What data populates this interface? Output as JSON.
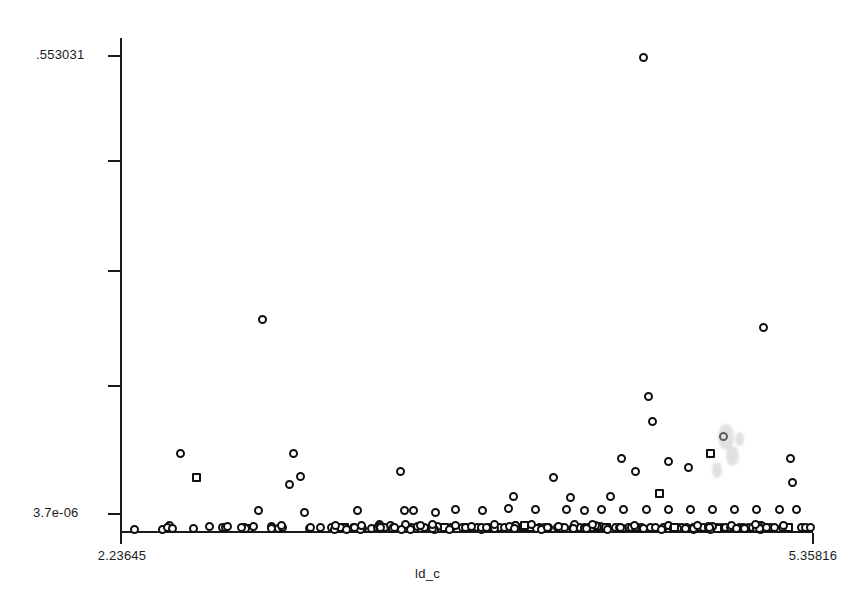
{
  "chart_data": {
    "type": "scatter",
    "title": "",
    "xlabel": "ld_c",
    "ylabel": "",
    "xlim": [
      2.23645,
      5.35816
    ],
    "ylim": [
      3.7e-06,
      0.553031
    ],
    "grid": false,
    "legend": null,
    "x_tick_labels": [
      "2.23645",
      "5.35816"
    ],
    "y_tick_labels": [
      "553031",
      "3.7e-06"
    ],
    "y_tick_label_top": ".553031",
    "y_tick_label_bottom": "3.7e-06",
    "n_y_ticks": 5,
    "n_points": 232,
    "marker": "open-circle",
    "points": [
      [
        2.3,
        0.002
      ],
      [
        2.43,
        0.002
      ],
      [
        2.64,
        0.005
      ],
      [
        2.7,
        0.0035
      ],
      [
        2.58,
        0.061
      ],
      [
        2.51,
        0.088
      ],
      [
        2.8,
        0.0045
      ],
      [
        2.86,
        0.023
      ],
      [
        2.92,
        0.0055
      ],
      [
        2.92,
        0.003
      ],
      [
        2.95,
        0.003
      ],
      [
        2.97,
        0.0035
      ],
      [
        3.02,
        0.088
      ],
      [
        3.05,
        0.062
      ],
      [
        3.0,
        0.053
      ],
      [
        3.07,
        0.021
      ],
      [
        3.09,
        0.003
      ],
      [
        2.88,
        0.241
      ],
      [
        3.14,
        0.004
      ],
      [
        3.19,
        0.0045
      ],
      [
        3.22,
        0.003
      ],
      [
        3.25,
        0.0035
      ],
      [
        3.29,
        0.0045
      ],
      [
        3.33,
        0.003
      ],
      [
        3.31,
        0.023
      ],
      [
        3.37,
        0.003
      ],
      [
        3.4,
        0.004
      ],
      [
        3.43,
        0.0035
      ],
      [
        3.46,
        0.0035
      ],
      [
        3.5,
        0.068
      ],
      [
        3.52,
        0.0235
      ],
      [
        3.55,
        0.0045
      ],
      [
        3.58,
        0.005
      ],
      [
        3.56,
        0.023
      ],
      [
        3.61,
        0.004
      ],
      [
        3.64,
        0.004
      ],
      [
        3.67,
        0.005
      ],
      [
        3.66,
        0.0215
      ],
      [
        3.7,
        0.004
      ],
      [
        3.73,
        0.0035
      ],
      [
        3.75,
        0.024
      ],
      [
        3.78,
        0.0035
      ],
      [
        3.8,
        0.0045
      ],
      [
        3.82,
        0.0035
      ],
      [
        3.85,
        0.004
      ],
      [
        3.87,
        0.023
      ],
      [
        3.9,
        0.0035
      ],
      [
        3.92,
        0.004
      ],
      [
        3.95,
        0.0035
      ],
      [
        3.97,
        0.004
      ],
      [
        3.99,
        0.026
      ],
      [
        4.01,
        0.039
      ],
      [
        4.03,
        0.0035
      ],
      [
        4.05,
        0.0045
      ],
      [
        4.07,
        0.0035
      ],
      [
        4.09,
        0.004
      ],
      [
        4.11,
        0.025
      ],
      [
        4.13,
        0.0035
      ],
      [
        4.15,
        0.004
      ],
      [
        4.17,
        0.0035
      ],
      [
        4.19,
        0.061
      ],
      [
        4.21,
        0.0045
      ],
      [
        4.23,
        0.0035
      ],
      [
        4.25,
        0.025
      ],
      [
        4.27,
        0.038
      ],
      [
        4.29,
        0.0035
      ],
      [
        4.31,
        0.004
      ],
      [
        4.33,
        0.023
      ],
      [
        4.35,
        0.0035
      ],
      [
        4.37,
        0.0045
      ],
      [
        4.39,
        0.0035
      ],
      [
        4.41,
        0.024
      ],
      [
        4.43,
        0.0035
      ],
      [
        4.45,
        0.039
      ],
      [
        4.47,
        0.004
      ],
      [
        4.49,
        0.0035
      ],
      [
        4.51,
        0.025
      ],
      [
        4.53,
        0.0035
      ],
      [
        4.55,
        0.0045
      ],
      [
        4.57,
        0.0035
      ],
      [
        4.5,
        0.082
      ],
      [
        4.56,
        0.068
      ],
      [
        4.59,
        0.0035
      ],
      [
        4.61,
        0.025
      ],
      [
        4.63,
        0.004
      ],
      [
        4.65,
        0.0035
      ],
      [
        4.62,
        0.153
      ],
      [
        4.64,
        0.125
      ],
      [
        4.6,
        0.539
      ],
      [
        4.67,
        0.043
      ],
      [
        4.69,
        0.0035
      ],
      [
        4.71,
        0.025
      ],
      [
        4.73,
        0.004
      ],
      [
        4.75,
        0.0035
      ],
      [
        4.71,
        0.079
      ],
      [
        4.77,
        0.0045
      ],
      [
        4.79,
        0.0035
      ],
      [
        4.81,
        0.025
      ],
      [
        4.83,
        0.004
      ],
      [
        4.85,
        0.0035
      ],
      [
        4.8,
        0.072
      ],
      [
        4.87,
        0.0045
      ],
      [
        4.89,
        0.0035
      ],
      [
        4.91,
        0.025
      ],
      [
        4.93,
        0.004
      ],
      [
        4.95,
        0.0035
      ],
      [
        4.9,
        0.088
      ],
      [
        4.97,
        0.0045
      ],
      [
        4.99,
        0.0035
      ],
      [
        5.01,
        0.025
      ],
      [
        5.03,
        0.004
      ],
      [
        5.05,
        0.0035
      ],
      [
        4.96,
        0.108
      ],
      [
        5.07,
        0.0045
      ],
      [
        5.09,
        0.0035
      ],
      [
        5.11,
        0.025
      ],
      [
        5.13,
        0.004
      ],
      [
        5.15,
        0.0035
      ],
      [
        5.14,
        0.232
      ],
      [
        5.17,
        0.0045
      ],
      [
        5.19,
        0.0035
      ],
      [
        5.21,
        0.025
      ],
      [
        5.23,
        0.004
      ],
      [
        5.25,
        0.0035
      ],
      [
        5.27,
        0.055
      ],
      [
        5.29,
        0.025
      ],
      [
        5.31,
        0.004
      ],
      [
        5.33,
        0.0035
      ],
      [
        5.26,
        0.083
      ],
      [
        5.35,
        0.0045
      ]
    ]
  },
  "axes": {
    "x_min_label": "2.23645",
    "x_max_label": "5.35816",
    "y_max_label": ".553031",
    "y_min_label": "3.7e-06",
    "x_axis_title": "ld_c"
  },
  "colors": {
    "axis": "#1a1a1a",
    "marker_stroke": "#101010",
    "marker_fill": "#ffffff",
    "background": "#ffffff",
    "text": "#1b1b1b"
  }
}
